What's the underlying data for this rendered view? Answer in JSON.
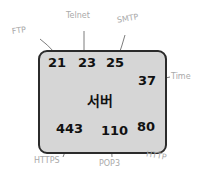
{
  "diagram": {
    "center_label": "서버",
    "ports": [
      {
        "port": "21",
        "protocol": "FTP"
      },
      {
        "port": "23",
        "protocol": "Telnet"
      },
      {
        "port": "25",
        "protocol": "SMTP"
      },
      {
        "port": "37",
        "protocol": "Time"
      },
      {
        "port": "443",
        "protocol": "HTTPS"
      },
      {
        "port": "110",
        "protocol": "POP3"
      },
      {
        "port": "80",
        "protocol": "HTTP"
      }
    ],
    "colors": {
      "box_fill": "#d6d6d6",
      "box_border": "#2b2b2b",
      "label": "#a9a9a9",
      "text": "#111111"
    }
  }
}
